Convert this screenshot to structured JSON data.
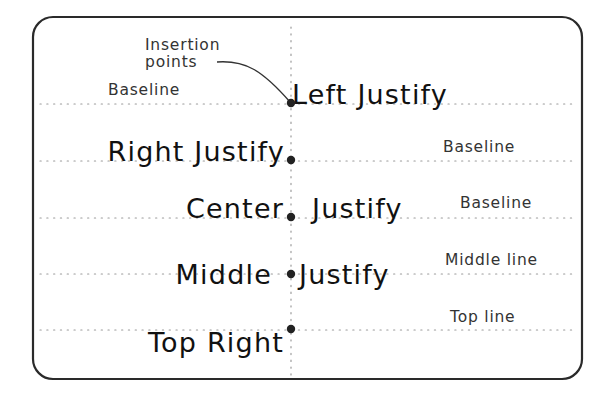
{
  "diagram": {
    "callout": {
      "line1": "Insertion",
      "line2": "points"
    },
    "rows": [
      {
        "text": "Left Justify",
        "justification": "left",
        "reference_label": "Baseline",
        "reference_label_side": "left"
      },
      {
        "text": "Right Justify",
        "justification": "right",
        "reference_label": "Baseline",
        "reference_label_side": "right"
      },
      {
        "text_left": "Center",
        "text_right": "Justify",
        "justification": "center",
        "reference_label": "Baseline",
        "reference_label_side": "right"
      },
      {
        "text_left": "Middle",
        "text_right": "Justify",
        "justification": "middle",
        "reference_label": "Middle line",
        "reference_label_side": "right"
      },
      {
        "text": "Top Right",
        "justification": "top-right",
        "reference_label": "Top line",
        "reference_label_side": "right"
      }
    ],
    "colors": {
      "frame": "#2a2a2a",
      "text": "#111111",
      "label": "#333333",
      "guide": "#9a9a9a",
      "insertion_point": "#222222"
    }
  }
}
